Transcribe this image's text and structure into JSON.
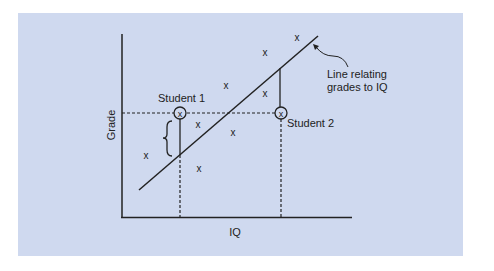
{
  "diagram": {
    "background_color": "#cfd9ef",
    "axes": {
      "x_label": "IQ",
      "y_label": "Grade"
    },
    "line_annotation": {
      "line1": "Line relating",
      "line2": "grades to IQ"
    },
    "students": [
      {
        "label": "Student 1",
        "marker": "x"
      },
      {
        "label": "Student 2",
        "marker": "x"
      }
    ],
    "point_marker": "x",
    "points_count": 8
  }
}
